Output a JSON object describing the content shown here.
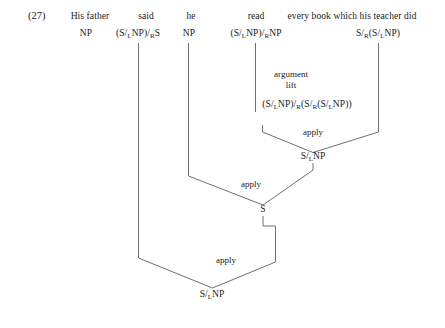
{
  "example_number": "(27)",
  "derivation": {
    "type": "ccg-derivation",
    "lexical_items": [
      {
        "word": "His father",
        "category": "NP",
        "category_html": "NP"
      },
      {
        "word": "said",
        "category": "(S/LNP)/RS",
        "category_html": "(S/<sub>L</sub>NP)/<sub>R</sub>S"
      },
      {
        "word": "he",
        "category": "NP",
        "category_html": "NP"
      },
      {
        "word": "read",
        "category": "(S/LNP)/RNP",
        "category_html": "(S/<sub>L</sub>NP)/<sub>R</sub>NP"
      },
      {
        "word": "every book which his teacher did",
        "category": "S/R(S/LNP)",
        "category_html": "S/<sub>R</sub>(S/<sub>L</sub>NP)"
      }
    ],
    "steps": [
      {
        "rule": "argument lift",
        "rule_line1": "argument",
        "rule_line2": "lift",
        "result": "(S/LNP)/R(S/R(S/LNP))",
        "result_html": "(S/<sub>L</sub>NP)/<sub>R</sub>(S/<sub>R</sub>(S/<sub>L</sub>NP))"
      },
      {
        "rule": "apply",
        "result": "S/LNP",
        "result_html": "S/<sub>L</sub>NP"
      },
      {
        "rule": "apply",
        "result": "S",
        "result_html": "S"
      },
      {
        "rule": "apply",
        "result": "S/LNP",
        "result_html": "S/<sub>L</sub>NP"
      }
    ]
  },
  "colors": {
    "ink": "#1a1a1a",
    "line": "#6f6f6f",
    "background": "#ffffff"
  }
}
